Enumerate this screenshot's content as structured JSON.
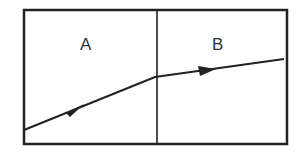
{
  "diagram": {
    "regions": [
      {
        "label": "A"
      },
      {
        "label": "B"
      }
    ],
    "ray": {
      "description": "ray passing from region A to region B, bending toward the boundary normal less steeply"
    }
  }
}
